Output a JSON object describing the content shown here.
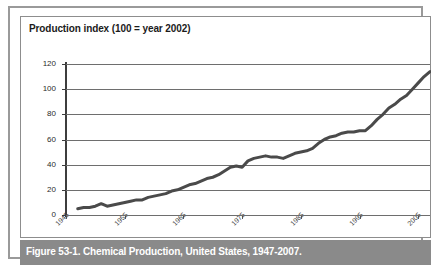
{
  "figure": {
    "caption": "Figure 53-1. Chemical Production, United States, 1947-2007.",
    "frame_color": "#9a9a9a",
    "caption_bar_color": "#8a8a8a",
    "caption_text_color": "#ffffff"
  },
  "chart_data": {
    "type": "line",
    "title": "Production index (100 = year 2002)",
    "xlabel": "",
    "ylabel": "",
    "xlim": [
      1945,
      2007
    ],
    "ylim": [
      0,
      120
    ],
    "grid": true,
    "legend": "none",
    "line_color": "#4a4a4a",
    "line_width": 3,
    "y_ticks": [
      0,
      20,
      40,
      60,
      80,
      100,
      120
    ],
    "y_tick_labels": [
      "0",
      "20",
      "40",
      "60",
      "80",
      "100",
      "120"
    ],
    "x_ticks": [
      1945,
      1955,
      1965,
      1975,
      1985,
      1995,
      2005
    ],
    "x_tick_labels": [
      "1945",
      "1955",
      "1965",
      "1975",
      "1985",
      "1995",
      "2005"
    ],
    "series": [
      {
        "name": "Chemical production index",
        "x": [
          1947,
          1948,
          1949,
          1950,
          1951,
          1952,
          1953,
          1954,
          1955,
          1956,
          1957,
          1958,
          1959,
          1960,
          1961,
          1962,
          1963,
          1964,
          1965,
          1966,
          1967,
          1968,
          1969,
          1970,
          1971,
          1972,
          1973,
          1974,
          1975,
          1976,
          1977,
          1978,
          1979,
          1980,
          1981,
          1982,
          1983,
          1984,
          1985,
          1986,
          1987,
          1988,
          1989,
          1990,
          1991,
          1992,
          1993,
          1994,
          1995,
          1996,
          1997,
          1998,
          1999,
          2000,
          2001,
          2002,
          2003,
          2004,
          2005,
          2006,
          2007
        ],
        "values": [
          5,
          6,
          6,
          7,
          9,
          7,
          8,
          9,
          10,
          11,
          12,
          12,
          14,
          15,
          16,
          17,
          19,
          20,
          22,
          24,
          25,
          27,
          29,
          30,
          32,
          35,
          38,
          39,
          38,
          43,
          45,
          46,
          47,
          46,
          46,
          45,
          47,
          49,
          50,
          51,
          53,
          57,
          60,
          62,
          63,
          65,
          66,
          66,
          67,
          67,
          71,
          76,
          80,
          85,
          88,
          92,
          95,
          100,
          105,
          110,
          114
        ]
      }
    ]
  }
}
